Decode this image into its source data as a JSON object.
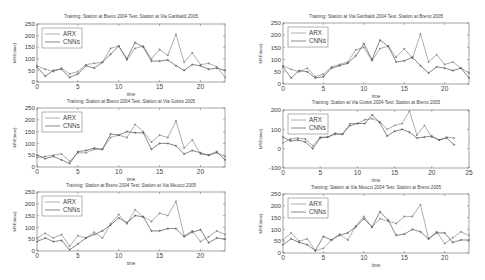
{
  "chart_data": [
    {
      "type": "line",
      "title": "Training: Station at Breno 2004 Test: Station at Via Garibaldi 2005",
      "xlabel": "time",
      "ylabel": "MSE(time)",
      "xlim": [
        0,
        23
      ],
      "ylim": [
        0,
        250
      ],
      "xticks": [
        0,
        5,
        10,
        15,
        20
      ],
      "yticks": [
        0,
        50,
        100,
        150,
        200,
        250
      ],
      "grid": false,
      "legend_position": "upper-left",
      "x": [
        0,
        1,
        2,
        3,
        4,
        5,
        6,
        7,
        8,
        9,
        10,
        11,
        12,
        13,
        14,
        15,
        16,
        17,
        18,
        19,
        20,
        21,
        22,
        23
      ],
      "series": [
        {
          "name": "ARX",
          "values": [
            70,
            55,
            45,
            60,
            35,
            45,
            75,
            80,
            85,
            145,
            155,
            95,
            145,
            155,
            100,
            140,
            115,
            205,
            85,
            125,
            75,
            80,
            65,
            20
          ]
        },
        {
          "name": "CNNs",
          "values": [
            65,
            25,
            50,
            55,
            20,
            35,
            70,
            60,
            85,
            120,
            155,
            100,
            170,
            150,
            90,
            90,
            95,
            70,
            50,
            75,
            70,
            55,
            60,
            50
          ]
        }
      ],
      "box": {
        "x": 37,
        "y": 24,
        "w": 188,
        "h": 58
      },
      "title_y": 18
    },
    {
      "type": "line",
      "title": "Training: Station at Breno 2004 Test: Station at Via Goisis 2005",
      "xlabel": "time",
      "ylabel": "MSE(time)",
      "xlim": [
        0,
        23
      ],
      "ylim": [
        0,
        250
      ],
      "xticks": [
        0,
        5,
        10,
        15,
        20
      ],
      "yticks": [
        0,
        50,
        100,
        150,
        200,
        250
      ],
      "grid": false,
      "legend_position": "upper-left",
      "x": [
        0,
        1,
        2,
        3,
        4,
        5,
        6,
        7,
        8,
        9,
        10,
        11,
        12,
        13,
        14,
        15,
        16,
        17,
        18,
        19,
        20,
        21,
        22,
        23
      ],
      "series": [
        {
          "name": "ARX",
          "values": [
            40,
            45,
            50,
            55,
            25,
            60,
            60,
            75,
            75,
            125,
            135,
            125,
            180,
            150,
            105,
            135,
            125,
            195,
            80,
            115,
            55,
            50,
            60,
            45
          ]
        },
        {
          "name": "CNNs",
          "values": [
            50,
            35,
            45,
            30,
            15,
            65,
            70,
            80,
            75,
            140,
            135,
            150,
            145,
            145,
            75,
            100,
            100,
            90,
            55,
            70,
            60,
            50,
            65,
            30
          ]
        }
      ],
      "box": {
        "x": 37,
        "y": 108,
        "w": 188,
        "h": 59
      },
      "title_y": 103
    },
    {
      "type": "line",
      "title": "Training: Station at Breno 2004 Test: Station at Via Meucci 2005",
      "xlabel": "time",
      "ylabel": "MSE(time)",
      "xlim": [
        0,
        23
      ],
      "ylim": [
        0,
        250
      ],
      "xticks": [
        0,
        5,
        10,
        15,
        20
      ],
      "yticks": [
        0,
        50,
        100,
        150,
        200,
        250
      ],
      "grid": false,
      "legend_position": "upper-left",
      "x": [
        0,
        1,
        2,
        3,
        4,
        5,
        6,
        7,
        8,
        9,
        10,
        11,
        12,
        13,
        14,
        15,
        16,
        17,
        18,
        19,
        20,
        21,
        22,
        23
      ],
      "series": [
        {
          "name": "ARX",
          "values": [
            55,
            75,
            55,
            70,
            20,
            65,
            55,
            80,
            55,
            115,
            155,
            115,
            175,
            145,
            125,
            160,
            150,
            210,
            65,
            85,
            40,
            60,
            85,
            70
          ]
        },
        {
          "name": "CNNs",
          "values": [
            40,
            55,
            40,
            45,
            5,
            30,
            55,
            70,
            85,
            110,
            140,
            120,
            150,
            145,
            85,
            85,
            95,
            95,
            60,
            80,
            90,
            35,
            55,
            50
          ]
        }
      ],
      "box": {
        "x": 37,
        "y": 192,
        "w": 188,
        "h": 59
      },
      "title_y": 187
    },
    {
      "type": "line",
      "title": "Training: Station at Via Garibaldi 2004 Test: Station at Breno 2005",
      "xlabel": "time",
      "ylabel": "MSE(time)",
      "xlim": [
        0,
        23
      ],
      "ylim": [
        0,
        250
      ],
      "xticks": [
        0,
        5,
        10,
        15,
        20
      ],
      "yticks": [
        0,
        50,
        100,
        150,
        200,
        250
      ],
      "grid": false,
      "legend_position": "upper-left",
      "x": [
        0,
        1,
        2,
        3,
        4,
        5,
        6,
        7,
        8,
        9,
        10,
        11,
        12,
        13,
        14,
        15,
        16,
        17,
        18,
        19,
        20,
        21,
        22,
        23
      ],
      "series": [
        {
          "name": "ARX",
          "values": [
            75,
            60,
            50,
            65,
            30,
            40,
            70,
            80,
            90,
            140,
            150,
            95,
            145,
            155,
            110,
            145,
            105,
            205,
            90,
            120,
            80,
            90,
            65,
            45
          ]
        },
        {
          "name": "CNNs",
          "values": [
            70,
            25,
            55,
            50,
            25,
            30,
            65,
            75,
            85,
            115,
            165,
            100,
            180,
            155,
            90,
            95,
            110,
            75,
            45,
            70,
            65,
            55,
            65,
            25
          ]
        }
      ],
      "box": {
        "x": 283,
        "y": 23,
        "w": 186,
        "h": 61
      },
      "title_y": 18
    },
    {
      "type": "line",
      "title": "Training: Station at Via Goisis 2004 Test: Station at Breno 2005",
      "xlabel": "time",
      "ylabel": "MSE(time)",
      "xlim": [
        0,
        25
      ],
      "ylim": [
        -100,
        200
      ],
      "xticks": [
        0,
        5,
        10,
        15,
        20,
        25
      ],
      "yticks": [
        -100,
        0,
        100,
        200
      ],
      "grid": false,
      "legend_position": "upper-left",
      "x": [
        0,
        1,
        2,
        3,
        4,
        5,
        6,
        7,
        8,
        9,
        10,
        11,
        12,
        13,
        14,
        15,
        16,
        17,
        18,
        19,
        20,
        21,
        22,
        23
      ],
      "series": [
        {
          "name": "ARX",
          "values": [
            30,
            50,
            55,
            50,
            15,
            60,
            60,
            80,
            75,
            130,
            130,
            150,
            155,
            140,
            100,
            120,
            130,
            195,
            70,
            120,
            60,
            45,
            60,
            55
          ]
        },
        {
          "name": "CNNs",
          "values": [
            60,
            40,
            45,
            35,
            0,
            55,
            60,
            75,
            75,
            120,
            130,
            130,
            175,
            135,
            65,
            90,
            100,
            85,
            55,
            60,
            65,
            45,
            55,
            20
          ]
        }
      ],
      "box": {
        "x": 283,
        "y": 110,
        "w": 186,
        "h": 58
      },
      "title_y": 104
    },
    {
      "type": "line",
      "title": "Training: Station at Via Meucci 2004 Test: Station at Breno 2005",
      "xlabel": "time",
      "ylabel": "MSE(time)",
      "xlim": [
        0,
        23
      ],
      "ylim": [
        0,
        250
      ],
      "xticks": [
        0,
        5,
        10,
        15,
        20
      ],
      "yticks": [
        0,
        50,
        100,
        150,
        200,
        250
      ],
      "grid": false,
      "legend_position": "upper-left",
      "x": [
        0,
        1,
        2,
        3,
        4,
        5,
        6,
        7,
        8,
        9,
        10,
        11,
        12,
        13,
        14,
        15,
        16,
        17,
        18,
        19,
        20,
        21,
        22,
        23
      ],
      "series": [
        {
          "name": "ARX",
          "values": [
            55,
            85,
            50,
            60,
            10,
            20,
            55,
            80,
            55,
            115,
            155,
            110,
            145,
            135,
            125,
            155,
            155,
            205,
            60,
            90,
            40,
            65,
            90,
            75
          ]
        },
        {
          "name": "CNNs",
          "values": [
            35,
            60,
            45,
            35,
            10,
            70,
            55,
            75,
            85,
            110,
            145,
            110,
            175,
            140,
            75,
            80,
            100,
            90,
            60,
            85,
            85,
            45,
            55,
            55
          ]
        }
      ],
      "box": {
        "x": 283,
        "y": 194,
        "w": 186,
        "h": 59
      },
      "title_y": 189
    }
  ],
  "legend": {
    "labels": [
      "ARX",
      "CNNs"
    ]
  },
  "colors": {
    "arx": "#8a8a8a",
    "cnns": "#555555",
    "axis": "#666666",
    "text": "#444444"
  }
}
